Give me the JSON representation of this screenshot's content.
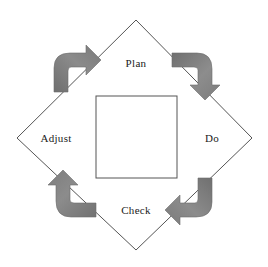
{
  "diagram": {
    "name": "PDCA improvement cycle",
    "stages": [
      {
        "id": "plan",
        "label": "Plan",
        "position": "top"
      },
      {
        "id": "do",
        "label": "Do",
        "position": "right"
      },
      {
        "id": "check",
        "label": "Check",
        "position": "bottom"
      },
      {
        "id": "adjust",
        "label": "Adjust",
        "position": "left"
      }
    ],
    "arrows": [
      {
        "id": "arrow-adjust-to-plan",
        "from": "Adjust",
        "to": "Plan",
        "corner": "top-left",
        "direction": "right"
      },
      {
        "id": "arrow-plan-to-do",
        "from": "Plan",
        "to": "Do",
        "corner": "top-right",
        "direction": "down"
      },
      {
        "id": "arrow-do-to-check",
        "from": "Do",
        "to": "Check",
        "corner": "bottom-right",
        "direction": "left"
      },
      {
        "id": "arrow-check-to-adjust",
        "from": "Check",
        "to": "Adjust",
        "corner": "bottom-left",
        "direction": "up"
      }
    ],
    "shapes": {
      "diamond": "diamond-outline",
      "square": "inner-square-outline"
    },
    "colors": {
      "background": "#ffffff",
      "line": "#555555",
      "arrow_fill": "#858585",
      "arrow_fill_dark": "#6f6f6f",
      "text": "#1a1a1a"
    }
  }
}
